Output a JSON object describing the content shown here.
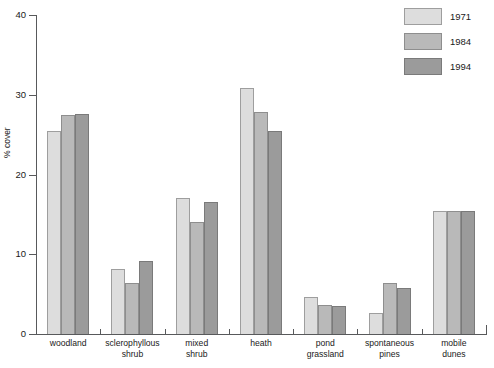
{
  "chart_data": {
    "type": "bar",
    "title": "",
    "xlabel": "",
    "ylabel": "% cover",
    "ylim": [
      0,
      40
    ],
    "yticks": [
      0,
      10,
      20,
      30,
      40
    ],
    "ytick_labels": [
      "0",
      "10",
      "20",
      "30",
      "40"
    ],
    "grid": false,
    "legend_position": "top-right",
    "grouping": "grouped",
    "categories": [
      "woodland",
      "sclerophyllous shrub",
      "mixed shrub",
      "heath",
      "pond grassland",
      "spontaneous pines",
      "mobile dunes"
    ],
    "category_lines": [
      [
        "woodland"
      ],
      [
        "sclerophyllous",
        "shrub"
      ],
      [
        "mixed",
        "shrub"
      ],
      [
        "heath"
      ],
      [
        "pond",
        "grassland"
      ],
      [
        "spontaneous",
        "pines"
      ],
      [
        "mobile",
        "dunes"
      ]
    ],
    "series": [
      {
        "name": "1971",
        "color": "#dddddd",
        "values": [
          25.5,
          8.1,
          17.0,
          30.8,
          4.6,
          2.6,
          15.4
        ]
      },
      {
        "name": "1984",
        "color": "#b9b9b9",
        "values": [
          27.5,
          6.4,
          14.0,
          27.8,
          3.6,
          6.4,
          15.4
        ]
      },
      {
        "name": "1994",
        "color": "#9b9b9b",
        "values": [
          27.6,
          9.1,
          16.6,
          25.5,
          3.5,
          5.8,
          15.4
        ]
      }
    ]
  },
  "legend": {
    "entries": [
      {
        "label": "1971",
        "swatch": "legend-swatch-1971"
      },
      {
        "label": "1984",
        "swatch": "legend-swatch-1984"
      },
      {
        "label": "1994",
        "swatch": "legend-swatch-1994"
      }
    ]
  },
  "axes": {
    "y_title": "% cover",
    "y_tick_labels": [
      "40",
      "30",
      "20",
      "10",
      "0"
    ]
  }
}
